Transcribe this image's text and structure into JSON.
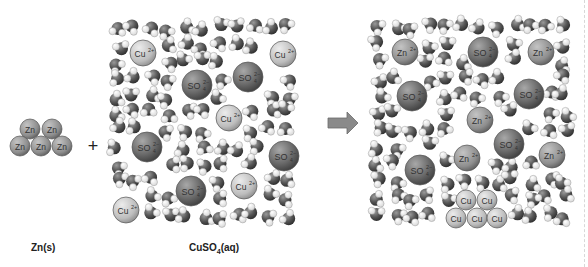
{
  "diagram": {
    "labels": {
      "zinc_solid": "Zn(s)",
      "copper_sulfate": "CuSO4(aq)",
      "copper_sulfate_sub": "4",
      "plus": "+"
    },
    "colors": {
      "water_oxygen": "#555555",
      "water_hydrogen": "#f4f4f4",
      "cation_light": "#c8c8c8",
      "sulfate_dark": "#6e6e6e",
      "arrow": "#8a8a8a"
    },
    "zinc_cluster": {
      "atoms": [
        {
          "x": 30,
          "y": 129,
          "text": "Zn"
        },
        {
          "x": 52,
          "y": 129,
          "text": "Zn"
        },
        {
          "x": 20,
          "y": 146,
          "text": "Zn"
        },
        {
          "x": 41,
          "y": 146,
          "text": "Zn"
        },
        {
          "x": 62,
          "y": 146,
          "text": "Zn"
        }
      ]
    },
    "left_solution": {
      "ions": [
        {
          "x": 143,
          "y": 53,
          "r": 13,
          "kind": "cu",
          "text": "Cu",
          "charge": "2+"
        },
        {
          "x": 283,
          "y": 54,
          "r": 13,
          "kind": "cu",
          "text": "Cu",
          "charge": "2+"
        },
        {
          "x": 197,
          "y": 85,
          "r": 15,
          "kind": "so4",
          "text": "SO",
          "charge": "2-"
        },
        {
          "x": 248,
          "y": 77,
          "r": 15,
          "kind": "so4",
          "text": "SO",
          "charge": "2-"
        },
        {
          "x": 229,
          "y": 118,
          "r": 13,
          "kind": "cu",
          "text": "Cu",
          "charge": "2+"
        },
        {
          "x": 147,
          "y": 147,
          "r": 15,
          "kind": "so4",
          "text": "SO",
          "charge": "2-"
        },
        {
          "x": 284,
          "y": 156,
          "r": 15,
          "kind": "so4",
          "text": "SO",
          "charge": "2-"
        },
        {
          "x": 191,
          "y": 191,
          "r": 15,
          "kind": "so4",
          "text": "SO",
          "charge": "2-"
        },
        {
          "x": 244,
          "y": 186,
          "r": 13,
          "kind": "cu",
          "text": "Cu",
          "charge": "2+"
        },
        {
          "x": 126,
          "y": 210,
          "r": 13,
          "kind": "cu",
          "text": "Cu",
          "charge": "2+"
        }
      ]
    },
    "right_solution": {
      "ions": [
        {
          "x": 405,
          "y": 52,
          "r": 13,
          "kind": "zn",
          "text": "Zn",
          "charge": "2+"
        },
        {
          "x": 483,
          "y": 52,
          "r": 15,
          "kind": "so4",
          "text": "SO",
          "charge": "2-"
        },
        {
          "x": 541,
          "y": 52,
          "r": 13,
          "kind": "zn",
          "text": "Zn",
          "charge": "2+"
        },
        {
          "x": 412,
          "y": 96,
          "r": 15,
          "kind": "so4",
          "text": "SO",
          "charge": "2-"
        },
        {
          "x": 529,
          "y": 94,
          "r": 15,
          "kind": "so4",
          "text": "SO",
          "charge": "2-"
        },
        {
          "x": 480,
          "y": 120,
          "r": 13,
          "kind": "zn",
          "text": "Zn",
          "charge": "2+"
        },
        {
          "x": 509,
          "y": 144,
          "r": 15,
          "kind": "so4",
          "text": "SO",
          "charge": "2-"
        },
        {
          "x": 552,
          "y": 155,
          "r": 13,
          "kind": "zn",
          "text": "Zn",
          "charge": "2+"
        },
        {
          "x": 467,
          "y": 158,
          "r": 13,
          "kind": "zn",
          "text": "Zn",
          "charge": "2+"
        },
        {
          "x": 420,
          "y": 170,
          "r": 15,
          "kind": "so4",
          "text": "SO",
          "charge": "2-"
        }
      ],
      "copper_cluster": [
        {
          "x": 466,
          "y": 200,
          "text": "Cu"
        },
        {
          "x": 487,
          "y": 200,
          "text": "Cu"
        },
        {
          "x": 456,
          "y": 218,
          "text": "Cu"
        },
        {
          "x": 477,
          "y": 218,
          "text": "Cu"
        },
        {
          "x": 497,
          "y": 218,
          "text": "Cu"
        }
      ]
    },
    "arrow": {
      "direction": "right",
      "x": 328,
      "y": 125
    }
  }
}
